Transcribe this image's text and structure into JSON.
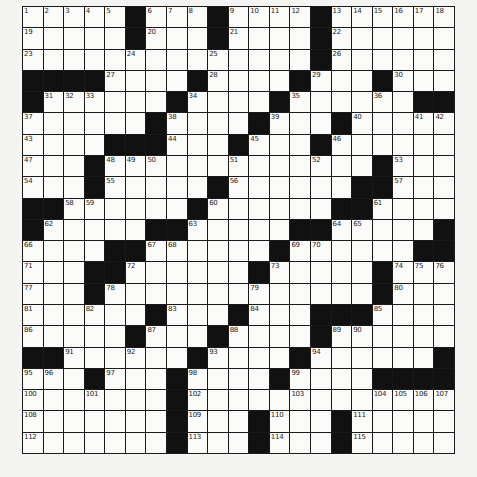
{
  "puzzle": {
    "rows": 21,
    "cols": 21,
    "colors": {
      "block": "#111111",
      "cell": "#fbfbf9",
      "line": "#1a1a1a",
      "paper": "#f4f4f2"
    },
    "grid": [
      "WWWWW#WWW#WWWW#WWWWWW",
      "WWWWW#WWW#WWWW#WWWWWW",
      "WWWWWWWWWWWWWW#WWWWWW",
      "####WWWW#WWWW#WWW#WWW",
      "#WWWWWW#WWWW#WWWWWW##",
      "WWWWWW#WWWW#WWW#WWWWW",
      "WWWW###WWW#WWW#WWWWWW",
      "WWW#WWWWWWWWWWWWW#WWW",
      "WWW#WWWWW#WWWWWW##WWW",
      "##WWWWWW#WWWWWW##WWWW",
      "#WWWWW##WWWWW##WWWWW#",
      "WWWW##WWWWWW#WWWWWW##",
      "WWW##WWWWWW#WWWWW#WWW",
      "WWW#WWWWWWWWWWWWW#WWW",
      "WWWWWW#WWW#WWW###WWWW",
      "WWWWW#WWW#WWWW#WWWWWW",
      "##WWWWWW#WWWW#WWWWWW#",
      "WWW#WWW#WWWW#WWWW####",
      "WWWWWWW#WWWWWWWWWWWWW",
      "WWWWWWW#WWW#WWW#WWWWW",
      "WWWWWWW#WWW#WWW#WWWWW"
    ],
    "numbers": [
      {
        "r": 0,
        "c": 0,
        "n": "1"
      },
      {
        "r": 0,
        "c": 1,
        "n": "2"
      },
      {
        "r": 0,
        "c": 2,
        "n": "3"
      },
      {
        "r": 0,
        "c": 3,
        "n": "4"
      },
      {
        "r": 0,
        "c": 4,
        "n": "5"
      },
      {
        "r": 0,
        "c": 6,
        "n": "6"
      },
      {
        "r": 0,
        "c": 7,
        "n": "7"
      },
      {
        "r": 0,
        "c": 8,
        "n": "8"
      },
      {
        "r": 0,
        "c": 10,
        "n": "9"
      },
      {
        "r": 0,
        "c": 11,
        "n": "10"
      },
      {
        "r": 0,
        "c": 12,
        "n": "11"
      },
      {
        "r": 0,
        "c": 13,
        "n": "12"
      },
      {
        "r": 0,
        "c": 15,
        "n": "13"
      },
      {
        "r": 0,
        "c": 16,
        "n": "14"
      },
      {
        "r": 0,
        "c": 17,
        "n": "15"
      },
      {
        "r": 0,
        "c": 18,
        "n": "16"
      },
      {
        "r": 0,
        "c": 19,
        "n": "17"
      },
      {
        "r": 0,
        "c": 20,
        "n": "18"
      },
      {
        "r": 1,
        "c": 0,
        "n": "19"
      },
      {
        "r": 1,
        "c": 6,
        "n": "20"
      },
      {
        "r": 1,
        "c": 10,
        "n": "21"
      },
      {
        "r": 1,
        "c": 15,
        "n": "22"
      },
      {
        "r": 2,
        "c": 0,
        "n": "23"
      },
      {
        "r": 2,
        "c": 5,
        "n": "24"
      },
      {
        "r": 2,
        "c": 9,
        "n": "25"
      },
      {
        "r": 2,
        "c": 15,
        "n": "26"
      },
      {
        "r": 3,
        "c": 4,
        "n": "27"
      },
      {
        "r": 3,
        "c": 9,
        "n": "28"
      },
      {
        "r": 3,
        "c": 14,
        "n": "29"
      },
      {
        "r": 3,
        "c": 18,
        "n": "30"
      },
      {
        "r": 4,
        "c": 1,
        "n": "31"
      },
      {
        "r": 4,
        "c": 2,
        "n": "32"
      },
      {
        "r": 4,
        "c": 3,
        "n": "33"
      },
      {
        "r": 4,
        "c": 8,
        "n": "34"
      },
      {
        "r": 4,
        "c": 13,
        "n": "35"
      },
      {
        "r": 4,
        "c": 17,
        "n": "36"
      },
      {
        "r": 5,
        "c": 0,
        "n": "37"
      },
      {
        "r": 5,
        "c": 7,
        "n": "38"
      },
      {
        "r": 5,
        "c": 12,
        "n": "39"
      },
      {
        "r": 5,
        "c": 16,
        "n": "40"
      },
      {
        "r": 5,
        "c": 19,
        "n": "41"
      },
      {
        "r": 5,
        "c": 20,
        "n": "42"
      },
      {
        "r": 6,
        "c": 0,
        "n": "43"
      },
      {
        "r": 6,
        "c": 7,
        "n": "44"
      },
      {
        "r": 6,
        "c": 11,
        "n": "45"
      },
      {
        "r": 6,
        "c": 15,
        "n": "46"
      },
      {
        "r": 7,
        "c": 0,
        "n": "47"
      },
      {
        "r": 7,
        "c": 4,
        "n": "48"
      },
      {
        "r": 7,
        "c": 5,
        "n": "49"
      },
      {
        "r": 7,
        "c": 6,
        "n": "50"
      },
      {
        "r": 7,
        "c": 10,
        "n": "51"
      },
      {
        "r": 7,
        "c": 14,
        "n": "52"
      },
      {
        "r": 7,
        "c": 18,
        "n": "53"
      },
      {
        "r": 8,
        "c": 0,
        "n": "54"
      },
      {
        "r": 8,
        "c": 4,
        "n": "55"
      },
      {
        "r": 8,
        "c": 10,
        "n": "56"
      },
      {
        "r": 8,
        "c": 18,
        "n": "57"
      },
      {
        "r": 9,
        "c": 2,
        "n": "58"
      },
      {
        "r": 9,
        "c": 3,
        "n": "59"
      },
      {
        "r": 9,
        "c": 9,
        "n": "60"
      },
      {
        "r": 9,
        "c": 17,
        "n": "61"
      },
      {
        "r": 10,
        "c": 1,
        "n": "62"
      },
      {
        "r": 10,
        "c": 8,
        "n": "63"
      },
      {
        "r": 10,
        "c": 15,
        "n": "64"
      },
      {
        "r": 10,
        "c": 16,
        "n": "65"
      },
      {
        "r": 11,
        "c": 0,
        "n": "66"
      },
      {
        "r": 11,
        "c": 6,
        "n": "67"
      },
      {
        "r": 11,
        "c": 7,
        "n": "68"
      },
      {
        "r": 11,
        "c": 13,
        "n": "69"
      },
      {
        "r": 11,
        "c": 14,
        "n": "70"
      },
      {
        "r": 12,
        "c": 0,
        "n": "71"
      },
      {
        "r": 12,
        "c": 5,
        "n": "72"
      },
      {
        "r": 12,
        "c": 12,
        "n": "73"
      },
      {
        "r": 12,
        "c": 18,
        "n": "74"
      },
      {
        "r": 12,
        "c": 19,
        "n": "75"
      },
      {
        "r": 12,
        "c": 20,
        "n": "76"
      },
      {
        "r": 13,
        "c": 0,
        "n": "77"
      },
      {
        "r": 13,
        "c": 4,
        "n": "78"
      },
      {
        "r": 13,
        "c": 11,
        "n": "79"
      },
      {
        "r": 13,
        "c": 18,
        "n": "80"
      },
      {
        "r": 14,
        "c": 0,
        "n": "81"
      },
      {
        "r": 14,
        "c": 3,
        "n": "82"
      },
      {
        "r": 14,
        "c": 7,
        "n": "83"
      },
      {
        "r": 14,
        "c": 11,
        "n": "84"
      },
      {
        "r": 14,
        "c": 17,
        "n": "85"
      },
      {
        "r": 15,
        "c": 0,
        "n": "86"
      },
      {
        "r": 15,
        "c": 6,
        "n": "87"
      },
      {
        "r": 15,
        "c": 10,
        "n": "88"
      },
      {
        "r": 15,
        "c": 15,
        "n": "89"
      },
      {
        "r": 15,
        "c": 16,
        "n": "90"
      },
      {
        "r": 16,
        "c": 2,
        "n": "91"
      },
      {
        "r": 16,
        "c": 5,
        "n": "92"
      },
      {
        "r": 16,
        "c": 9,
        "n": "93"
      },
      {
        "r": 16,
        "c": 14,
        "n": "94"
      },
      {
        "r": 17,
        "c": 0,
        "n": "95"
      },
      {
        "r": 17,
        "c": 1,
        "n": "96"
      },
      {
        "r": 17,
        "c": 4,
        "n": "97"
      },
      {
        "r": 17,
        "c": 8,
        "n": "98"
      },
      {
        "r": 17,
        "c": 13,
        "n": "99"
      },
      {
        "r": 18,
        "c": 0,
        "n": "100"
      },
      {
        "r": 18,
        "c": 3,
        "n": "101"
      },
      {
        "r": 18,
        "c": 8,
        "n": "102"
      },
      {
        "r": 18,
        "c": 13,
        "n": "103"
      },
      {
        "r": 18,
        "c": 17,
        "n": "104"
      },
      {
        "r": 18,
        "c": 18,
        "n": "105"
      },
      {
        "r": 18,
        "c": 19,
        "n": "106"
      },
      {
        "r": 18,
        "c": 20,
        "n": "107"
      },
      {
        "r": 19,
        "c": 0,
        "n": "108"
      },
      {
        "r": 19,
        "c": 8,
        "n": "109"
      },
      {
        "r": 19,
        "c": 12,
        "n": "110"
      },
      {
        "r": 19,
        "c": 16,
        "n": "111"
      },
      {
        "r": 20,
        "c": 0,
        "n": "112"
      },
      {
        "r": 20,
        "c": 8,
        "n": "113"
      },
      {
        "r": 20,
        "c": 12,
        "n": "114"
      },
      {
        "r": 20,
        "c": 16,
        "n": "115"
      }
    ]
  }
}
